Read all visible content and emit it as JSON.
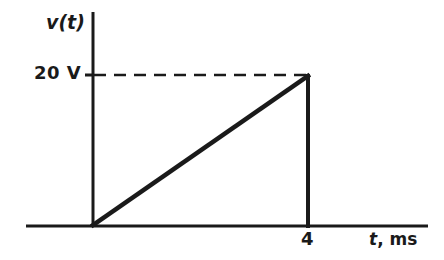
{
  "figure": {
    "background_color": "#ffffff",
    "ink_color": "#1a1a1a",
    "width": 444,
    "height": 260
  },
  "labels": {
    "y_axis_label": "v(t)",
    "y_tick_label": "20 V",
    "x_tick_label": "4",
    "x_axis_variable": "t",
    "x_axis_unit": ", ms"
  },
  "chart_data": {
    "type": "line",
    "title": "",
    "subtitle": "",
    "xlabel": "t, ms",
    "ylabel": "v(t)",
    "series": [
      {
        "name": "v(t)",
        "x": [
          0,
          4,
          4
        ],
        "y": [
          0,
          20,
          0
        ]
      }
    ],
    "x": [
      0,
      4,
      4
    ],
    "values": [
      0,
      20,
      0
    ],
    "xlim": [
      -0.9,
      6.2
    ],
    "ylim": [
      0,
      23.5
    ],
    "xticks": [
      4
    ],
    "xtick_labels": [
      "4"
    ],
    "yticks": [
      20
    ],
    "ytick_labels": [
      "20 V"
    ],
    "grid": false,
    "legend": false,
    "legend_position": "none",
    "annotations": [
      {
        "kind": "dashed-guide",
        "orientation": "horizontal",
        "value": 20,
        "from_x": 0,
        "to_x": 4,
        "label": "20 V"
      },
      {
        "kind": "vertical-drop",
        "at_x": 4,
        "from_y": 20,
        "to_y": 0
      }
    ]
  },
  "geometry": {
    "x_axis": {
      "x1": 26,
      "y1": 226,
      "x2": 428,
      "y2": 226,
      "width": 3
    },
    "y_axis": {
      "x1": 93,
      "y1": 12,
      "x2": 93,
      "y2": 226,
      "width": 3
    },
    "y_tick": {
      "x1": 85,
      "y1": 75,
      "x2": 93,
      "y2": 75,
      "width": 3
    },
    "ramp": {
      "x1": 93,
      "y1": 225,
      "x2": 308,
      "y2": 76,
      "width": 4.5
    },
    "drop": {
      "x1": 308,
      "y1": 76,
      "x2": 308,
      "y2": 226,
      "width": 4
    },
    "dashed": {
      "x1": 94,
      "y1": 75,
      "x2": 306,
      "y2": 75,
      "width": 2.6,
      "dash": "12 8"
    }
  }
}
